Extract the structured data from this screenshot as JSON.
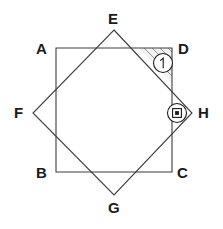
{
  "figure": {
    "background_color": "#ffffff",
    "stroke_color": "#3d3d3d",
    "label_color": "#1a1a1a",
    "hatch_color": "#6b6b6b",
    "labels": {
      "a": "A",
      "b": "B",
      "c": "C",
      "d": "D",
      "e": "E",
      "f": "F",
      "g": "G",
      "h": "H"
    },
    "markers": {
      "angle_marker_label": "1",
      "right_angle_marker_label": "□"
    },
    "shapes": {
      "square": {
        "name": "ABCD",
        "vertices": [
          {
            "label": "A",
            "x": 56,
            "y": 48
          },
          {
            "label": "D",
            "x": 172,
            "y": 48
          },
          {
            "label": "C",
            "x": 172,
            "y": 172
          },
          {
            "label": "B",
            "x": 56,
            "y": 172
          }
        ]
      },
      "diamond": {
        "name": "EHGF",
        "vertices": [
          {
            "label": "E",
            "x": 114,
            "y": 30
          },
          {
            "label": "H",
            "x": 192,
            "y": 113
          },
          {
            "label": "G",
            "x": 114,
            "y": 195
          },
          {
            "label": "F",
            "x": 33,
            "y": 113
          }
        ]
      },
      "shaded_region": {
        "name": "corner-triangle-at-D",
        "vertices": [
          {
            "x": 139,
            "y": 48
          },
          {
            "x": 172,
            "y": 48
          },
          {
            "x": 172,
            "y": 83
          }
        ]
      }
    }
  }
}
